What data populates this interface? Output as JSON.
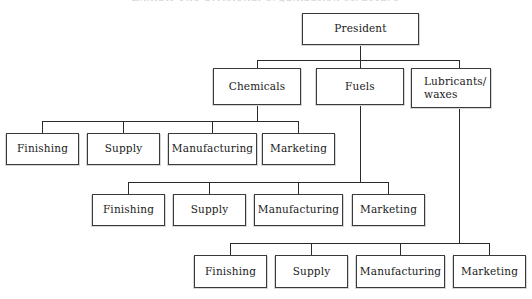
{
  "chart_meta": {
    "type": "org-chart",
    "title_remnant": "Exhibit   The divisional organization structure",
    "background_color": "#ffffff",
    "line_color": "#2b2b2b",
    "box_border_color": "#3a3a3a",
    "text_color": "#1a1a1a",
    "width": 532,
    "height": 299
  },
  "nodes": {
    "president": {
      "label": "President"
    },
    "divisions": [
      {
        "label": "Chemicals"
      },
      {
        "label": "Fuels"
      },
      {
        "label": "Lubricants/",
        "label_line2": "waxes"
      }
    ],
    "functions_chemicals": [
      {
        "label": "Finishing"
      },
      {
        "label": "Supply"
      },
      {
        "label": "Manufacturing"
      },
      {
        "label": "Marketing"
      }
    ],
    "functions_fuels": [
      {
        "label": "Finishing"
      },
      {
        "label": "Supply"
      },
      {
        "label": "Manufacturing"
      },
      {
        "label": "Marketing"
      }
    ],
    "functions_lubricants": [
      {
        "label": "Finishing"
      },
      {
        "label": "Supply"
      },
      {
        "label": "Manufacturing"
      },
      {
        "label": "Marketing"
      }
    ]
  }
}
